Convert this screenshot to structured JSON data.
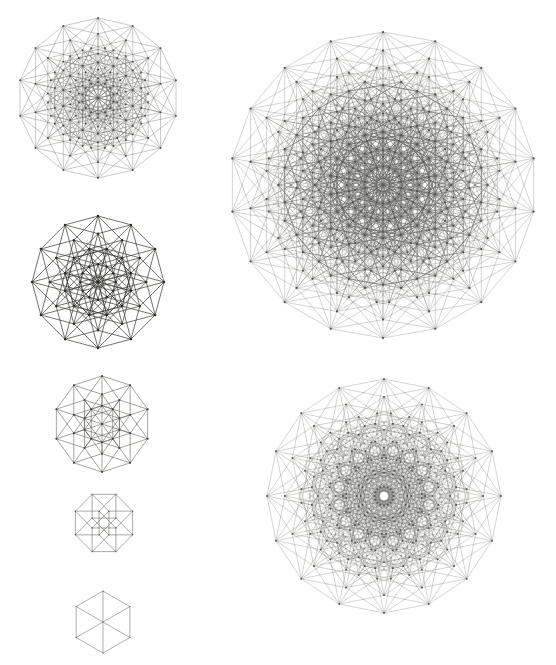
{
  "figure": {
    "background": "#ffffff",
    "line_color": "#3a3a34",
    "vertex_color": "#1e1e1a",
    "projections": [
      {
        "id": "cube-7",
        "dimension": 7,
        "petrie_polygon_sides": 14,
        "center": [
          98,
          98
        ],
        "radius": 80,
        "rotation_deg": -90,
        "stroke_width": 0.35,
        "vertex_radius": 0.9,
        "opacity": 0.8
      },
      {
        "id": "cube-6",
        "dimension": 6,
        "petrie_polygon_sides": 12,
        "center": [
          98,
          282
        ],
        "radius": 66,
        "rotation_deg": -90,
        "stroke_width": 0.75,
        "vertex_radius": 1.2,
        "opacity": 0.95
      },
      {
        "id": "cube-5",
        "dimension": 5,
        "petrie_polygon_sides": 10,
        "center": [
          102,
          424
        ],
        "radius": 48,
        "rotation_deg": -90,
        "stroke_width": 0.55,
        "vertex_radius": 1.0,
        "opacity": 0.85
      },
      {
        "id": "cube-4",
        "dimension": 4,
        "petrie_polygon_sides": 8,
        "center": [
          104,
          523
        ],
        "radius": 31,
        "rotation_deg": -67.5,
        "stroke_width": 0.55,
        "vertex_radius": 0.7,
        "opacity": 0.8
      },
      {
        "id": "cube-3",
        "dimension": 3,
        "petrie_polygon_sides": 6,
        "center": [
          103,
          622
        ],
        "radius": 31,
        "rotation_deg": -90,
        "stroke_width": 0.55,
        "vertex_radius": 0.6,
        "opacity": 0.75
      },
      {
        "id": "cube-9",
        "dimension": 9,
        "petrie_polygon_sides": 18,
        "center": [
          383,
          185
        ],
        "radius": 153,
        "rotation_deg": -90,
        "stroke_width": 0.3,
        "vertex_radius": 1.1,
        "opacity": 0.75
      },
      {
        "id": "cube-8",
        "dimension": 8,
        "petrie_polygon_sides": 16,
        "center": [
          384,
          496
        ],
        "radius": 117,
        "rotation_deg": -90,
        "stroke_width": 0.3,
        "vertex_radius": 0.9,
        "opacity": 0.75
      }
    ]
  }
}
